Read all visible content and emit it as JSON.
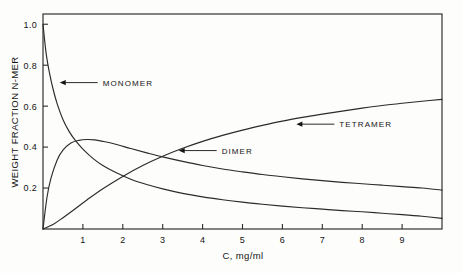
{
  "chart_data": {
    "type": "line",
    "title": "",
    "xlabel": "C, mg/ml",
    "ylabel": "WEIGHT FRACTION N-MER",
    "xlim": [
      0,
      10
    ],
    "ylim": [
      0,
      1.05
    ],
    "grid": false,
    "legend_position": "inline-annotations",
    "xticks": [
      1,
      2,
      3,
      4,
      5,
      6,
      7,
      8,
      9
    ],
    "xtick_labels": [
      "1",
      "2",
      "3",
      "4",
      "5",
      "6",
      "7",
      "8",
      "9"
    ],
    "yticks": [
      0.2,
      0.4,
      0.6,
      0.8,
      1.0
    ],
    "ytick_labels": [
      "0.2",
      "0.4",
      "0.6",
      "0.8",
      "1.0"
    ],
    "annotations": [
      {
        "label": "MONOMER",
        "target_x": 0.42,
        "target_y": 0.715
      },
      {
        "label": "TETRAMER",
        "target_x": 6.35,
        "target_y": 0.512
      },
      {
        "label": "DIMER",
        "target_x": 3.4,
        "target_y": 0.383
      }
    ],
    "series": [
      {
        "name": "MONOMER",
        "x": [
          0,
          0.08,
          0.16,
          0.25,
          0.35,
          0.5,
          0.65,
          0.8,
          1.0,
          1.25,
          1.5,
          1.8,
          2.2,
          2.6,
          3.0,
          3.5,
          4.0,
          4.5,
          5.0,
          5.5,
          6.0,
          6.5,
          7.0,
          7.5,
          8.0,
          8.5,
          9.0,
          9.5,
          10.0
        ],
        "y": [
          1.0,
          0.855,
          0.765,
          0.685,
          0.615,
          0.535,
          0.478,
          0.435,
          0.39,
          0.345,
          0.31,
          0.278,
          0.243,
          0.217,
          0.196,
          0.174,
          0.157,
          0.143,
          0.131,
          0.121,
          0.112,
          0.104,
          0.097,
          0.09,
          0.084,
          0.077,
          0.07,
          0.062,
          0.052
        ]
      },
      {
        "name": "DIMER",
        "x": [
          0,
          0.1,
          0.2,
          0.35,
          0.5,
          0.7,
          0.9,
          1.1,
          1.3,
          1.5,
          1.8,
          2.2,
          2.6,
          3.0,
          3.5,
          4.0,
          4.5,
          5.0,
          5.5,
          6.0,
          6.5,
          7.0,
          7.5,
          8.0,
          8.5,
          9.0,
          9.5,
          10.0
        ],
        "y": [
          0,
          0.155,
          0.248,
          0.335,
          0.385,
          0.42,
          0.433,
          0.437,
          0.435,
          0.428,
          0.415,
          0.393,
          0.372,
          0.352,
          0.33,
          0.31,
          0.293,
          0.279,
          0.266,
          0.255,
          0.245,
          0.236,
          0.228,
          0.221,
          0.214,
          0.207,
          0.2,
          0.19
        ]
      },
      {
        "name": "TETRAMER",
        "x": [
          0,
          0.25,
          0.5,
          0.8,
          1.1,
          1.5,
          2.0,
          2.5,
          3.0,
          3.5,
          4.0,
          4.5,
          5.0,
          5.5,
          6.0,
          6.5,
          7.0,
          7.5,
          8.0,
          8.5,
          9.0,
          9.5,
          10.0
        ],
        "y": [
          0,
          0.022,
          0.055,
          0.098,
          0.142,
          0.197,
          0.257,
          0.31,
          0.355,
          0.394,
          0.428,
          0.457,
          0.483,
          0.506,
          0.527,
          0.545,
          0.561,
          0.576,
          0.59,
          0.603,
          0.614,
          0.624,
          0.633
        ]
      }
    ]
  },
  "figure": {
    "caption": ""
  }
}
